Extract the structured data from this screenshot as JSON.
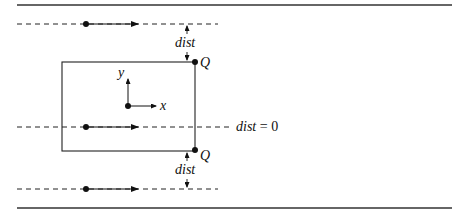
{
  "diagram": {
    "labels": {
      "dist_top": "dist",
      "dist_bottom": "dist",
      "q_top": "Q",
      "q_bottom": "Q",
      "axis_y": "y",
      "axis_x": "x",
      "dist_zero_var": "dist",
      "dist_zero_eq": " = 0"
    },
    "elements": {
      "horizontal_rules": 2,
      "dashed_lines": 3,
      "rectangle": 1,
      "points": [
        "line-top-start",
        "line-mid-start",
        "line-bottom-start",
        "origin",
        "Q-top",
        "Q-bottom"
      ]
    },
    "colors": {
      "ink": "#111111",
      "background": "#ffffff"
    }
  }
}
